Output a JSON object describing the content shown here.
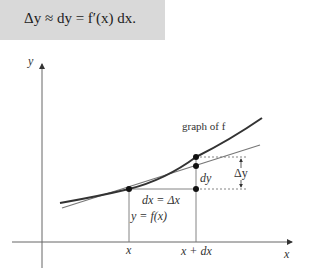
{
  "formula": {
    "text": "Δy ≈ dy = f′(x) dx.",
    "background": "#d9d9d9"
  },
  "diagram": {
    "axes": {
      "x_label": "x",
      "y_label": "y"
    },
    "labels": {
      "graph_label": "graph of f",
      "dy": "dy",
      "delta_y": "Δy",
      "dx_eq": "dx = Δx",
      "y_eq": "y = f(x)",
      "x_tick": "x",
      "x_plus_dx_tick": "x + dx"
    },
    "colors": {
      "curve": "#333333",
      "tangent": "#777777",
      "axis": "#555555",
      "guide": "#777777"
    }
  }
}
